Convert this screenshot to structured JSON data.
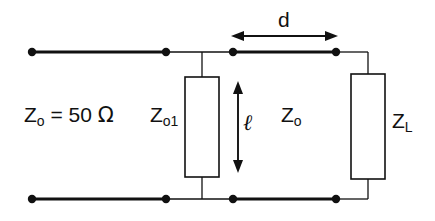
{
  "figure": {
    "name": "transmission-line-with-shunt-stub",
    "background_color": "#ffffff",
    "ink_color": "#111111",
    "width": 435,
    "height": 221
  },
  "labels": {
    "source_impedance": {
      "symbol": "Z",
      "subscript": "o",
      "equals": " = 50 ",
      "unit": "Ω",
      "full_text": "Z_o = 50 Ω"
    },
    "stub_impedance": {
      "symbol": "Z",
      "subscript": "o1",
      "full_text": "Z_o1"
    },
    "line_impedance": {
      "symbol": "Z",
      "subscript": "o",
      "full_text": "Z_o"
    },
    "load_impedance": {
      "symbol": "Z",
      "subscript": "L",
      "full_text": "Z_L"
    },
    "distance_d": "d",
    "stub_length": "ℓ"
  },
  "components": {
    "stub": {
      "name": "Z_o1",
      "orientation": "vertical",
      "fill": "#ffffff",
      "stroke": "#111111"
    },
    "load": {
      "name": "Z_L",
      "orientation": "vertical",
      "fill": "#ffffff",
      "stroke": "#111111"
    }
  },
  "nodes": [
    {
      "name": "top-left-terminal",
      "x": 32,
      "y": 52
    },
    {
      "name": "top-left-inner",
      "x": 166,
      "y": 52
    },
    {
      "name": "top-stub-junction-node",
      "x": 233,
      "y": 52
    },
    {
      "name": "top-load-node",
      "x": 336,
      "y": 52
    },
    {
      "name": "bottom-left-terminal",
      "x": 32,
      "y": 199
    },
    {
      "name": "bottom-left-inner",
      "x": 166,
      "y": 199
    },
    {
      "name": "bottom-stub-junction-node",
      "x": 233,
      "y": 199
    },
    {
      "name": "bottom-load-node",
      "x": 336,
      "y": 199
    }
  ],
  "dimensions": {
    "d_arrow": {
      "label": "d",
      "x_start": 233,
      "x_end": 336,
      "y": 36
    },
    "ell_arrow": {
      "label": "ℓ",
      "x": 238,
      "y_start": 82,
      "y_end": 172
    }
  }
}
